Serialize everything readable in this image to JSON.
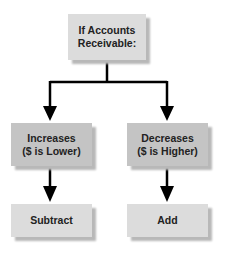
{
  "diagram": {
    "root": {
      "label_line1": "If Accounts",
      "label_line2": "Receivable:"
    },
    "branches": [
      {
        "label_line1": "Increases",
        "label_line2": "($ is Lower)",
        "result": "Subtract"
      },
      {
        "label_line1": "Decreases",
        "label_line2": "($ is Higher)",
        "result": "Add"
      }
    ]
  },
  "colors": {
    "root_fill": "#dcdcdc",
    "branch_fill": "#c4c4c4",
    "result_fill": "#dcdcdc",
    "arrow": "#000000"
  }
}
